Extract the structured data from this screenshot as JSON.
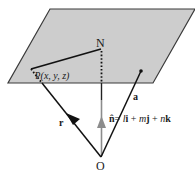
{
  "diagram": {
    "colors": {
      "plane_fill": "#cdcdcd",
      "plane_edge": "#3a3a3a",
      "line": "#111111",
      "normal_vector": "#8c8c8c",
      "background": "#ffffff"
    },
    "plane": {
      "corners": [
        [
          50,
          9
        ],
        [
          195,
          9
        ],
        [
          153,
          83
        ],
        [
          8,
          83
        ]
      ]
    },
    "points": {
      "O": {
        "label": "O",
        "x": 101,
        "y": 157
      },
      "N": {
        "label": "N",
        "x": 102,
        "y": 49
      },
      "P": {
        "label": "P(x, y, z)",
        "x": 31,
        "y": 69
      },
      "A": {
        "x": 141,
        "y": 71
      }
    },
    "labels": {
      "O": "O",
      "N": "N",
      "P_name": "P",
      "P_coords": "(x, y, z)",
      "r": "r",
      "a": "a",
      "n_hat": "n̂",
      "n_eq": "= ",
      "l": "l",
      "i": "i",
      "plus1": " + ",
      "m": "m",
      "j": "j",
      "plus2": " + ",
      "n": "n",
      "k": "k"
    },
    "vectors": [
      {
        "name": "r",
        "from": "O",
        "to": "P",
        "style": "solid-then-dotted-in-plane",
        "arrow": "black"
      },
      {
        "name": "a",
        "from": "O",
        "to": "A",
        "style": "solid"
      },
      {
        "name": "n_hat",
        "from": "O",
        "to": "N",
        "style": "gray-then-solid-then-dotted",
        "arrow": "gray"
      },
      {
        "name": "PN",
        "from": "P",
        "to": "N",
        "style": "solid"
      }
    ],
    "equation": "n̂ = li + mj + nk"
  }
}
